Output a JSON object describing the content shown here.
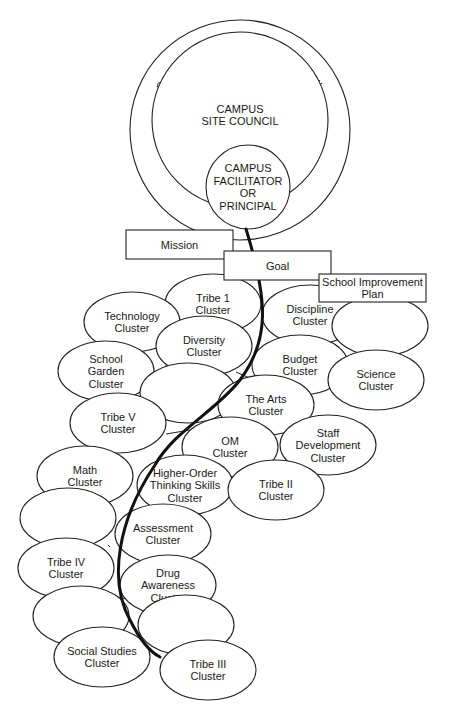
{
  "diagram": {
    "title_arc": "CAMPUS PERFORMANCE COUNCIL",
    "colors": {
      "stroke": "#222222",
      "spine": "#111111",
      "background": "#ffffff",
      "text": "#1a1a1a"
    },
    "councils": {
      "performance": {
        "label": "CAMPUS PERFORMANCE COUNCIL",
        "cx": 240,
        "cy": 130,
        "r": 110
      },
      "site": {
        "lines": [
          "CAMPUS",
          "SITE COUNCIL"
        ],
        "cx": 240,
        "cy": 120,
        "r": 88
      },
      "facilitator": {
        "lines": [
          "CAMPUS",
          "FACILITATOR",
          "OR",
          "PRINCIPAL"
        ],
        "cx": 248,
        "cy": 187,
        "r": 42
      }
    },
    "boxes": [
      {
        "id": "mission",
        "label": "Mission",
        "x": 126,
        "y": 230,
        "w": 107,
        "h": 29
      },
      {
        "id": "goal",
        "label": "Goal",
        "x": 224,
        "y": 251,
        "w": 107,
        "h": 29
      },
      {
        "id": "school-improvement-plan",
        "lines": [
          "School Improvement",
          "Plan"
        ],
        "x": 319,
        "y": 274,
        "w": 107,
        "h": 28
      }
    ],
    "clusters": [
      {
        "id": "tribe-1",
        "lines": [
          "Tribe 1",
          "Cluster"
        ],
        "cx": 213,
        "cy": 304,
        "rx": 48,
        "ry": 30
      },
      {
        "id": "technology",
        "lines": [
          "Technology",
          "Cluster"
        ],
        "cx": 132,
        "cy": 322,
        "rx": 48,
        "ry": 30
      },
      {
        "id": "diversity",
        "lines": [
          "Diversity",
          "Cluster"
        ],
        "cx": 204,
        "cy": 346,
        "rx": 48,
        "ry": 30
      },
      {
        "id": "discipline",
        "lines": [
          "Discipline",
          "Cluster"
        ],
        "cx": 310,
        "cy": 315,
        "rx": 48,
        "ry": 30
      },
      {
        "id": "blank-right-1",
        "lines": [],
        "cx": 380,
        "cy": 326,
        "rx": 48,
        "ry": 30
      },
      {
        "id": "school-garden",
        "lines": [
          "School",
          "Garden",
          "Cluster"
        ],
        "cx": 106,
        "cy": 371,
        "rx": 48,
        "ry": 30
      },
      {
        "id": "blank-mid-1",
        "lines": [],
        "cx": 188,
        "cy": 393,
        "rx": 48,
        "ry": 30
      },
      {
        "id": "budget",
        "lines": [
          "Budget",
          "Cluster"
        ],
        "cx": 300,
        "cy": 365,
        "rx": 48,
        "ry": 30
      },
      {
        "id": "science",
        "lines": [
          "Science",
          "Cluster"
        ],
        "cx": 376,
        "cy": 380,
        "rx": 48,
        "ry": 30
      },
      {
        "id": "the-arts",
        "lines": [
          "The Arts",
          "Cluster"
        ],
        "cx": 266,
        "cy": 405,
        "rx": 48,
        "ry": 30
      },
      {
        "id": "tribe-v",
        "lines": [
          "Tribe V",
          "Cluster"
        ],
        "cx": 118,
        "cy": 423,
        "rx": 48,
        "ry": 30
      },
      {
        "id": "om",
        "lines": [
          "OM",
          "Cluster"
        ],
        "cx": 230,
        "cy": 447,
        "rx": 48,
        "ry": 30
      },
      {
        "id": "staff-development",
        "lines": [
          "Staff",
          "Development",
          "Cluster"
        ],
        "cx": 328,
        "cy": 445,
        "rx": 48,
        "ry": 30
      },
      {
        "id": "math",
        "lines": [
          "Math",
          "Cluster"
        ],
        "cx": 85,
        "cy": 476,
        "rx": 48,
        "ry": 30
      },
      {
        "id": "higher-order-thinking-skills",
        "lines": [
          "Higher-Order",
          "Thinking Skills",
          "Cluster"
        ],
        "cx": 185,
        "cy": 485,
        "rx": 48,
        "ry": 30
      },
      {
        "id": "tribe-ii",
        "lines": [
          "Tribe II",
          "Cluster"
        ],
        "cx": 276,
        "cy": 490,
        "rx": 48,
        "ry": 30
      },
      {
        "id": "blank-left-1",
        "lines": [],
        "cx": 68,
        "cy": 518,
        "rx": 48,
        "ry": 30
      },
      {
        "id": "assessment",
        "lines": [
          "Assessment",
          "Cluster"
        ],
        "cx": 163,
        "cy": 534,
        "rx": 48,
        "ry": 30
      },
      {
        "id": "tribe-iv",
        "lines": [
          "Tribe IV",
          "Cluster"
        ],
        "cx": 66,
        "cy": 568,
        "rx": 48,
        "ry": 30
      },
      {
        "id": "drug-awareness",
        "lines": [
          "Drug",
          "Awareness",
          "Cluster"
        ],
        "cx": 168,
        "cy": 585,
        "rx": 48,
        "ry": 30
      },
      {
        "id": "blank-left-2",
        "lines": [],
        "cx": 81,
        "cy": 616,
        "rx": 48,
        "ry": 30
      },
      {
        "id": "blank-mid-2",
        "lines": [],
        "cx": 186,
        "cy": 625,
        "rx": 48,
        "ry": 30
      },
      {
        "id": "social-studies",
        "lines": [
          "Social Studies",
          "Cluster"
        ],
        "cx": 102,
        "cy": 657,
        "rx": 48,
        "ry": 30
      },
      {
        "id": "tribe-iii",
        "lines": [
          "Tribe III",
          "Cluster"
        ],
        "cx": 208,
        "cy": 670,
        "rx": 48,
        "ry": 30
      }
    ],
    "spine_path": "M 246 229 C 268 300, 270 340, 240 380 C 215 412, 175 430, 155 465 C 118 520, 108 580, 130 620 C 140 640, 150 652, 160 657"
  }
}
